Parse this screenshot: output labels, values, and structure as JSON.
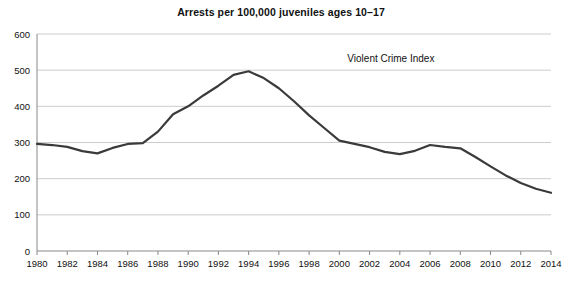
{
  "chart_data": {
    "type": "line",
    "title": "Arrests per 100,000 juveniles ages 10–17",
    "xlabel": "",
    "ylabel": "",
    "xlim": [
      1980,
      2014
    ],
    "ylim": [
      0,
      600
    ],
    "grid": "horizontal",
    "legend_position": "inside-top-right",
    "annotation": "Violent Crime Index",
    "series": [
      {
        "name": "Violent Crime Index",
        "color": "#3a3a3a",
        "x": [
          1980,
          1981,
          1982,
          1983,
          1984,
          1985,
          1986,
          1987,
          1988,
          1989,
          1990,
          1991,
          1992,
          1993,
          1994,
          1995,
          1996,
          1997,
          1998,
          1999,
          2000,
          2001,
          2002,
          2003,
          2004,
          2005,
          2006,
          2007,
          2008,
          2009,
          2010,
          2011,
          2012,
          2013,
          2014
        ],
        "values": [
          296,
          293,
          288,
          276,
          270,
          285,
          296,
          298,
          330,
          378,
          400,
          430,
          457,
          487,
          497,
          478,
          450,
          414,
          375,
          340,
          305,
          296,
          287,
          274,
          268,
          277,
          293,
          288,
          284,
          260,
          234,
          209,
          188,
          172,
          161
        ]
      }
    ],
    "y_ticks": [
      0,
      100,
      200,
      300,
      400,
      500,
      600
    ],
    "x_ticks": [
      1980,
      1982,
      1984,
      1986,
      1988,
      1990,
      1992,
      1994,
      1996,
      1998,
      2000,
      2002,
      2004,
      2006,
      2008,
      2010,
      2012,
      2014
    ],
    "x_tick_labels": [
      "1980",
      "1982",
      "1984",
      "1986",
      "1988",
      "1990",
      "1992",
      "1994",
      "1996",
      "1998",
      "2000",
      "2002",
      "2004",
      "2006",
      "2008",
      "2010",
      "2012",
      "2014"
    ],
    "y_tick_labels": [
      "0",
      "100",
      "200",
      "300",
      "400",
      "500",
      "600"
    ]
  }
}
